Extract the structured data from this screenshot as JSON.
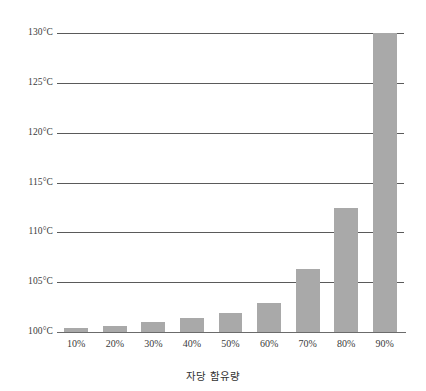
{
  "chart_data": {
    "type": "bar",
    "title": "",
    "subtitle": "",
    "xlabel": "자당 함유량",
    "ylabel": "",
    "categories": [
      "10%",
      "20%",
      "30%",
      "40%",
      "50%",
      "60%",
      "70%",
      "80%",
      "90%"
    ],
    "values": [
      100.4,
      100.6,
      101.0,
      101.4,
      101.9,
      102.9,
      106.3,
      112.4,
      130.0
    ],
    "value_unit": "°C",
    "ylim": [
      100,
      130
    ],
    "ytick_values": [
      100,
      105,
      110,
      115,
      120,
      125,
      130
    ],
    "ytick_labels": [
      "100°C",
      "105°C",
      "110°C",
      "115°C",
      "120°C",
      "125°C",
      "130°C"
    ],
    "grid": true,
    "grid_axis": "y",
    "legend": false,
    "legend_position": "none",
    "bar_color": "#a9a9a9",
    "gridline_color": "#5a5a5a",
    "background_color": "#ffffff",
    "series": [
      {
        "name": "끓는점",
        "values": [
          100.4,
          100.6,
          101.0,
          101.4,
          101.9,
          102.9,
          106.3,
          112.4,
          130.0
        ]
      }
    ]
  }
}
